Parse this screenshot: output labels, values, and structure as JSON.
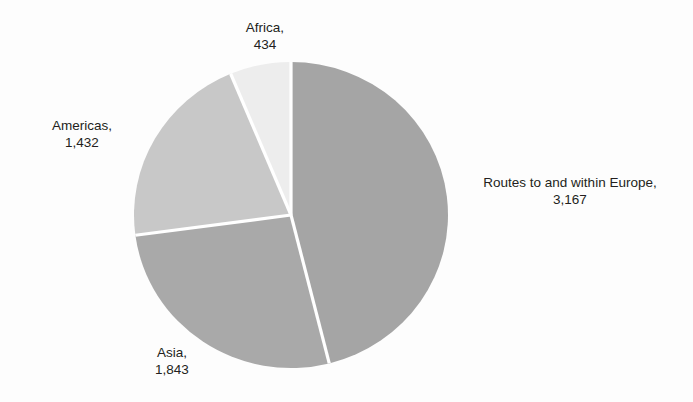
{
  "chart_data": {
    "type": "pie",
    "title": "",
    "title_clipped": true,
    "categories": [
      "Routes to and within Europe",
      "Asia",
      "Americas",
      "Africa"
    ],
    "values": [
      3167,
      1843,
      1432,
      434
    ],
    "value_labels": [
      "3,167",
      "1,843",
      "1,432",
      "434"
    ],
    "total": 6876,
    "percentages": [
      46.1,
      26.8,
      20.8,
      6.3
    ],
    "start_angle_deg": 0,
    "direction": "clockwise",
    "legend": "none",
    "labels_position": "outside-callout",
    "grid": false,
    "xlabel": "",
    "ylabel": "",
    "colors": [
      "#a5a5a5",
      "#a9a9a9",
      "#c8c8c8",
      "#ededed"
    ],
    "separator_color": "#ffffff",
    "background": "#fdfdfd",
    "slices": [
      {
        "name": "Routes to and within Europe",
        "label_name": "Routes to and within Europe,",
        "label_value": "3,167",
        "value": 3167,
        "percent": 46.1,
        "color": "#a5a5a5",
        "start_deg": 0,
        "end_deg": 165.9
      },
      {
        "name": "Asia",
        "label_name": "Asia,",
        "label_value": "1,843",
        "value": 1843,
        "percent": 26.8,
        "color": "#a9a9a9",
        "start_deg": 165.9,
        "end_deg": 262.4
      },
      {
        "name": "Americas",
        "label_name": "Americas,",
        "label_value": "1,432",
        "value": 1432,
        "percent": 20.8,
        "color": "#c8c8c8",
        "start_deg": 262.4,
        "end_deg": 337.4
      },
      {
        "name": "Africa",
        "label_name": "Africa,",
        "label_value": "434",
        "value": 434,
        "percent": 6.3,
        "color": "#ededed",
        "start_deg": 337.4,
        "end_deg": 360
      }
    ]
  },
  "geometry": {
    "center_x": 291,
    "center_y": 215,
    "radius_x": 157,
    "radius_y": 153
  }
}
